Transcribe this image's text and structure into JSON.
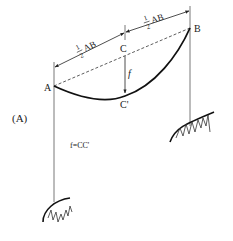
{
  "figure": {
    "label": "(A)",
    "points": {
      "A": "A",
      "B": "B",
      "C": "C",
      "C_prime": "C'"
    },
    "dimension_left": {
      "fraction_num": "1",
      "fraction_den": "2",
      "text": "AB"
    },
    "dimension_right": {
      "fraction_num": "1",
      "fraction_den": "2",
      "text": "AB"
    },
    "sag_symbol": "f",
    "formula": "f=CC'"
  },
  "colors": {
    "line": "#222222",
    "thin_line": "#555555"
  }
}
